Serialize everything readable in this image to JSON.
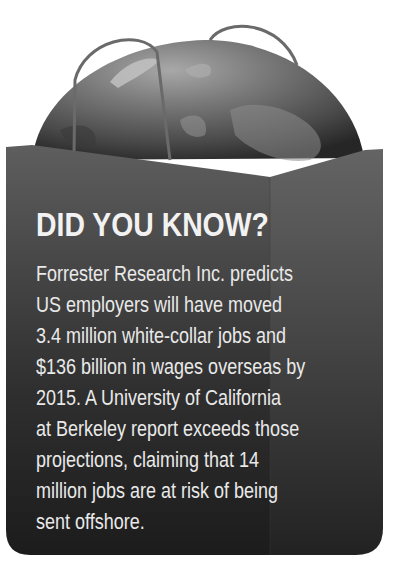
{
  "callout": {
    "headline": "DID YOU KNOW?",
    "body_lines": [
      "Forrester Research Inc. predicts",
      "US employers will have moved",
      "3.4 million white-collar jobs and",
      "$136 billion in wages overseas by",
      "2015. A University of California",
      "at Berkeley report exceeds those",
      "projections, claiming that 14",
      "million jobs are at risk of being",
      "sent offshore."
    ]
  },
  "illustration": {
    "subject": "globe-in-shopping-bag",
    "icons": [
      "globe-icon",
      "shopping-bag-icon",
      "bag-handle-icon"
    ]
  },
  "colors": {
    "bag_top": "#5a5a5a",
    "bag_bottom": "#1e1e1e",
    "globe_light": "#9a9a9a",
    "globe_dark": "#2e2e2e",
    "text": "#eeeeee",
    "background": "#ffffff"
  }
}
